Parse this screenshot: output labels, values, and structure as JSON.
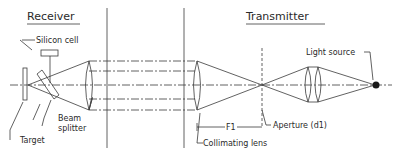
{
  "diagram": {
    "type": "optical-schematic",
    "sections": {
      "receiver": "Receiver",
      "transmitter": "Transmitter"
    },
    "labels": {
      "silicon_cell": "Silicon cell",
      "beam_splitter_1": "Beam",
      "beam_splitter_2": "splitter",
      "target": "Target",
      "light_source": "Light source",
      "aperture": "Aperture (d1)",
      "focal_length": "F1",
      "collimating_lens": "Collimating lens"
    },
    "colors": {
      "line": "#3a3a3a",
      "background": "#ffffff"
    }
  }
}
